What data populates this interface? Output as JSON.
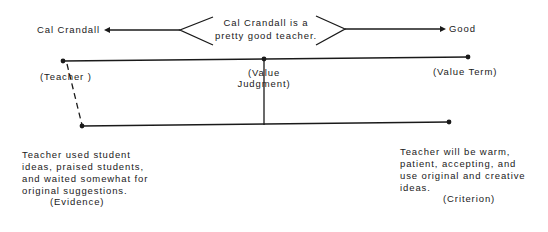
{
  "argument": {
    "statement_line1": "Cal Crandall is a",
    "statement_line2": "pretty good teacher.",
    "left_term": "Cal Crandall",
    "right_term": "Good"
  },
  "labels": {
    "teacher": "(Teacher )",
    "value_judgment_line1": "(Value",
    "value_judgment_line2": "Judgment)",
    "value_term": "(Value Term)"
  },
  "evidence": {
    "lines": [
      "Teacher used student",
      "ideas, praised students,",
      "and waited somewhat for",
      "original suggestions."
    ],
    "label": "(Evidence)"
  },
  "criterion": {
    "lines": [
      "Teacher will be warm,",
      "patient, accepting, and",
      "use original and creative",
      "ideas."
    ],
    "label": "(Criterion)"
  },
  "colors": {
    "ink": "#1a1a1a",
    "background": "#ffffff"
  }
}
